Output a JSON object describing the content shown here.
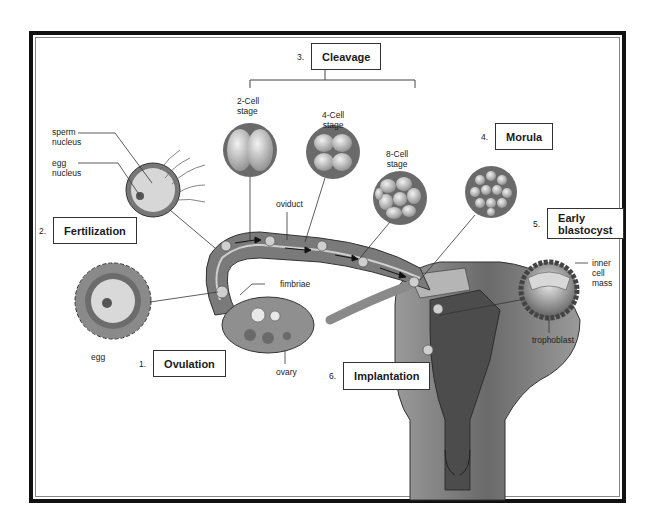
{
  "diagram": {
    "steps": [
      {
        "number": "1.",
        "label": "Ovulation"
      },
      {
        "number": "2.",
        "label": "Fertilization"
      },
      {
        "number": "3.",
        "label": "Cleavage"
      },
      {
        "number": "4.",
        "label": "Morula"
      },
      {
        "number": "5.",
        "label": "Early\nblastocyst"
      },
      {
        "number": "6.",
        "label": "Implantation"
      }
    ],
    "labels": {
      "sperm_nucleus": "sperm\nnucleus",
      "egg_nucleus": "egg\nnucleus",
      "egg": "egg",
      "two_cell": "2-Cell\nstage",
      "four_cell": "4-Cell\nstage",
      "eight_cell": "8-Cell\nstage",
      "oviduct": "oviduct",
      "fimbriae": "fimbriae",
      "ovary": "ovary",
      "inner_cell_mass": "inner\ncell\nmass",
      "trophoblast": "trophoblast"
    },
    "colors": {
      "frame": "#111111",
      "tissue_dark": "#555555",
      "tissue_mid": "#8a8a8a",
      "tissue_light": "#bdbdbd",
      "cell_fill": "#d6d6d6"
    }
  }
}
